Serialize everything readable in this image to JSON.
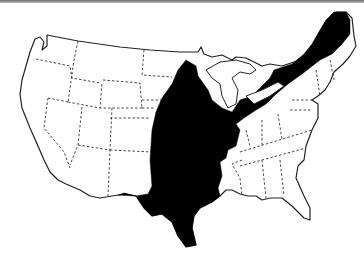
{
  "map": {
    "subject": "Contiguous United States",
    "style": "black-and-white outline map",
    "state_borders": "dashed",
    "highlighted_region": {
      "fill_color": "#000000",
      "description": "Black band extending from Texas north through the Great Plains and Midwest, along the Great Lakes, to northern New England"
    },
    "background_color": "#ffffff",
    "top_bar_color": "#7a7a7a"
  }
}
